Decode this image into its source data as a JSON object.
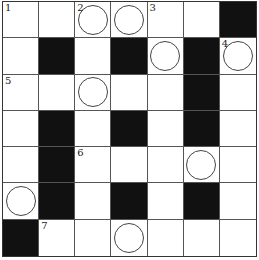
{
  "puzzle": {
    "rows": 7,
    "cols": 7,
    "cells": [
      [
        {
          "n": "1"
        },
        {},
        {
          "n": "2",
          "c": 1
        },
        {
          "c": 1
        },
        {
          "n": "3"
        },
        {},
        {
          "b": 1
        }
      ],
      [
        {},
        {
          "b": 1
        },
        {},
        {
          "b": 1
        },
        {
          "c": 1
        },
        {
          "b": 1
        },
        {
          "n": "4",
          "c": 1
        }
      ],
      [
        {
          "n": "5"
        },
        {},
        {
          "c": 1
        },
        {},
        {},
        {
          "b": 1
        },
        {}
      ],
      [
        {},
        {
          "b": 1
        },
        {},
        {
          "b": 1
        },
        {},
        {
          "b": 1
        },
        {}
      ],
      [
        {},
        {
          "b": 1
        },
        {
          "n": "6"
        },
        {},
        {},
        {
          "c": 1
        },
        {}
      ],
      [
        {
          "c": 1
        },
        {
          "b": 1
        },
        {},
        {
          "b": 1
        },
        {},
        {
          "b": 1
        },
        {}
      ],
      [
        {
          "b": 1
        },
        {
          "n": "7"
        },
        {},
        {
          "c": 1
        },
        {},
        {},
        {}
      ]
    ]
  }
}
